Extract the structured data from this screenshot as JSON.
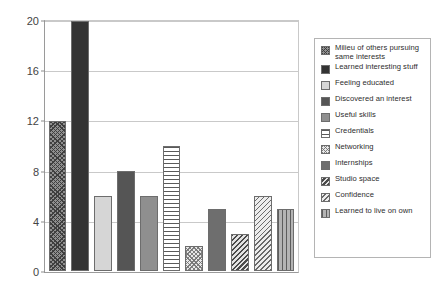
{
  "chart_data": {
    "type": "bar",
    "title": "",
    "subtitle": "",
    "xlabel": "",
    "ylabel": "",
    "ylim": [
      0,
      20
    ],
    "yticks": [
      0,
      4,
      8,
      12,
      16,
      20
    ],
    "ytick_labels": [
      "0",
      "4",
      "8",
      "12",
      "16",
      "20"
    ],
    "grid": true,
    "xtick_labels": [],
    "legend_position": "right",
    "categories": [
      "Milieu of others pursuing same interests",
      "Learned interesting stuff",
      "Feeling educated",
      "Discovered an interest",
      "Useful skills",
      "Credentials",
      "Networking",
      "Internships",
      "Studio space",
      "Confidence",
      "Learned to live on own"
    ],
    "values": [
      12,
      20,
      6,
      8,
      6,
      10,
      2,
      5,
      3,
      6,
      5
    ],
    "bars": [
      {
        "label": "Milieu of others pursuing same interests",
        "value": 12,
        "pattern": "diagonal-crosshatch-dark",
        "color": "#8f8f8f"
      },
      {
        "label": "Learned interesting stuff",
        "value": 20,
        "pattern": "solid",
        "color": "#333333"
      },
      {
        "label": "Feeling educated",
        "value": 6,
        "pattern": "solid",
        "color": "#d6d6d6"
      },
      {
        "label": "Discovered an interest",
        "value": 8,
        "pattern": "solid",
        "color": "#555555"
      },
      {
        "label": "Useful skills",
        "value": 6,
        "pattern": "solid",
        "color": "#8f8f8f"
      },
      {
        "label": "Credentials",
        "value": 10,
        "pattern": "horizontal-stripes",
        "color": "#ffffff"
      },
      {
        "label": "Networking",
        "value": 2,
        "pattern": "checkerboard-light",
        "color": "#e8e8e8"
      },
      {
        "label": "Internships",
        "value": 5,
        "pattern": "solid",
        "color": "#6e6e6e"
      },
      {
        "label": "Studio space",
        "value": 3,
        "pattern": "diagonal-hatch-dense",
        "color": "#bdbdbd"
      },
      {
        "label": "Confidence",
        "value": 6,
        "pattern": "diagonal-hatch-light",
        "color": "#cfcfcf"
      },
      {
        "label": "Learned to live on own",
        "value": 5,
        "pattern": "vertical-stripes",
        "color": "#9a9a9a"
      }
    ]
  },
  "legend": {
    "items": [
      {
        "label": "Milieu of others pursuing same interests",
        "swatch": "swatch-crosshatch-dark"
      },
      {
        "label": "Learned interesting stuff",
        "swatch": "swatch-solid-verydark"
      },
      {
        "label": "Feeling educated",
        "swatch": "swatch-solid-light"
      },
      {
        "label": "Discovered an interest",
        "swatch": "swatch-solid-dark"
      },
      {
        "label": "Useful skills",
        "swatch": "swatch-solid-medium"
      },
      {
        "label": "Credentials",
        "swatch": "swatch-horizontal-stripes"
      },
      {
        "label": "Networking",
        "swatch": "swatch-checkerboard-light"
      },
      {
        "label": "Internships",
        "swatch": "swatch-solid-medium-dark"
      },
      {
        "label": "Studio space",
        "swatch": "swatch-diagonal-dense"
      },
      {
        "label": "Confidence",
        "swatch": "swatch-diagonal-light"
      },
      {
        "label": "Learned to live on own",
        "swatch": "swatch-vertical-stripes"
      }
    ]
  }
}
